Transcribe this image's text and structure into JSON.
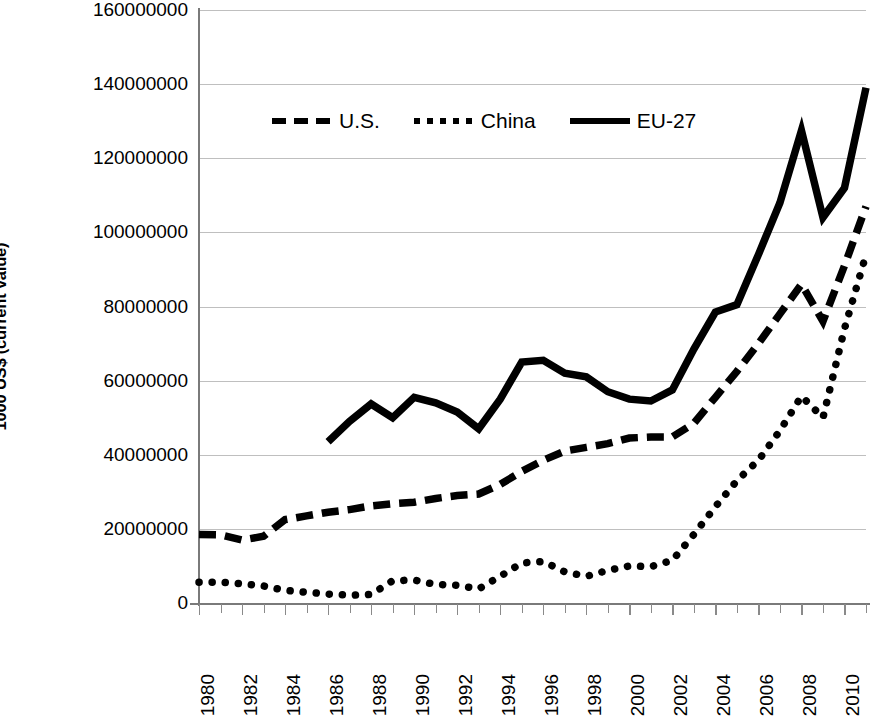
{
  "chart_data": {
    "type": "line",
    "title": "",
    "xlabel": "",
    "ylabel": "1000 US$ (current value)",
    "xlim": [
      1980,
      2011
    ],
    "ylim": [
      0,
      160000000
    ],
    "grid": true,
    "legend_position": "top-center",
    "y_ticks": [
      0,
      20000000,
      40000000,
      60000000,
      80000000,
      100000000,
      120000000,
      140000000,
      160000000
    ],
    "y_tick_labels": [
      "0",
      "20000000",
      "40000000",
      "60000000",
      "80000000",
      "100000000",
      "120000000",
      "140000000",
      "160000000"
    ],
    "x_ticks": [
      1980,
      1981,
      1982,
      1983,
      1984,
      1985,
      1986,
      1987,
      1988,
      1989,
      1990,
      1991,
      1992,
      1993,
      1994,
      1995,
      1996,
      1997,
      1998,
      1999,
      2000,
      2001,
      2002,
      2003,
      2004,
      2005,
      2006,
      2007,
      2008,
      2009,
      2010,
      2011
    ],
    "x_tick_labels": [
      "1980",
      "1982",
      "1984",
      "1986",
      "1988",
      "1990",
      "1992",
      "1994",
      "1996",
      "1998",
      "2000",
      "2002",
      "2004",
      "2006",
      "2008",
      "2010"
    ],
    "x_labeled_years": [
      1980,
      1982,
      1984,
      1986,
      1988,
      1990,
      1992,
      1994,
      1996,
      1998,
      2000,
      2002,
      2004,
      2006,
      2008,
      2010
    ],
    "series": [
      {
        "name": "U.S.",
        "style": "dashed",
        "color": "#000000",
        "x": [
          1980,
          1981,
          1982,
          1983,
          1984,
          1985,
          1986,
          1987,
          1988,
          1989,
          1990,
          1991,
          1992,
          1993,
          1994,
          1995,
          1996,
          1997,
          1998,
          1999,
          2000,
          2001,
          2002,
          2003,
          2004,
          2005,
          2006,
          2007,
          2008,
          2009,
          2010,
          2011
        ],
        "values": [
          18500000,
          18400000,
          17000000,
          18000000,
          22500000,
          23500000,
          24500000,
          25200000,
          26200000,
          26800000,
          27200000,
          28200000,
          29000000,
          29400000,
          32000000,
          35500000,
          38500000,
          41000000,
          42000000,
          43000000,
          44500000,
          44800000,
          44800000,
          48500000,
          55500000,
          62500000,
          70000000,
          78000000,
          86000000,
          76000000,
          91000000,
          107000000
        ]
      },
      {
        "name": "China",
        "style": "dotted",
        "color": "#000000",
        "x": [
          1980,
          1981,
          1982,
          1983,
          1984,
          1985,
          1986,
          1987,
          1988,
          1989,
          1990,
          1991,
          1992,
          1993,
          1994,
          1995,
          1996,
          1997,
          1998,
          1999,
          2000,
          2001,
          2002,
          2003,
          2004,
          2005,
          2006,
          2007,
          2008,
          2009,
          2010,
          2011
        ],
        "values": [
          5600000,
          5600000,
          5200000,
          4600000,
          3400000,
          2900000,
          2400000,
          2100000,
          2300000,
          6000000,
          6200000,
          5000000,
          4800000,
          3800000,
          7200000,
          10800000,
          11200000,
          8400000,
          7200000,
          8800000,
          10000000,
          9800000,
          11500000,
          18500000,
          26000000,
          33000000,
          38500000,
          46500000,
          55800000,
          50000000,
          74000000,
          94000000
        ]
      },
      {
        "name": "EU-27",
        "style": "solid",
        "color": "#000000",
        "x": [
          1986,
          1987,
          1988,
          1989,
          1990,
          1991,
          1992,
          1993,
          1994,
          1995,
          1996,
          1997,
          1998,
          1999,
          2000,
          2001,
          2002,
          2003,
          2004,
          2005,
          2006,
          2007,
          2008,
          2009,
          2010,
          2011
        ],
        "values": [
          43500000,
          49000000,
          53700000,
          50000000,
          55500000,
          54000000,
          51500000,
          47000000,
          55000000,
          65000000,
          65500000,
          62000000,
          61000000,
          57000000,
          55000000,
          54500000,
          57500000,
          68500000,
          78500000,
          80500000,
          94000000,
          108000000,
          127500000,
          104000000,
          112000000,
          139000000
        ]
      }
    ]
  },
  "legend": {
    "items": [
      {
        "label": "U.S.",
        "style": "dashed"
      },
      {
        "label": "China",
        "style": "dotted"
      },
      {
        "label": "EU-27",
        "style": "solid"
      }
    ]
  }
}
